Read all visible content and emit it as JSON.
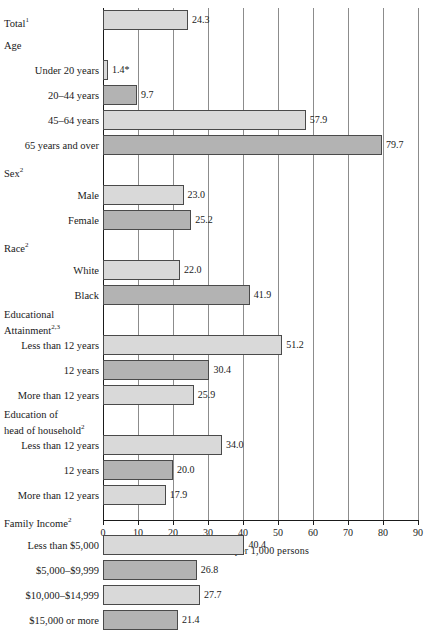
{
  "chart_data": {
    "type": "bar",
    "orientation": "horizontal",
    "title": "",
    "subtitle": "",
    "xlabel": "Rate per 1,000  persons",
    "ylabel": "",
    "xlim": [
      0,
      90
    ],
    "xticks": [
      0,
      10,
      20,
      30,
      40,
      50,
      60,
      70,
      80,
      90
    ],
    "xticklabels": [
      "0",
      "10",
      "20",
      "30",
      "40",
      "50",
      "60",
      "70",
      "80",
      "90"
    ],
    "grid": true,
    "grid_axis": "x",
    "legend": null,
    "colors": {
      "bar_light": "#d9d9d9",
      "bar_dark": "#b3b3b3",
      "bar_border": "#4a4a4a",
      "gridline": "#8c8c8c",
      "axis": "#1a1a1a"
    },
    "footnote_markers": [
      "1",
      "2",
      "3",
      "*"
    ],
    "rows": [
      {
        "kind": "bar",
        "indent": 0,
        "label": "Total",
        "sup": "1",
        "value": 24.3,
        "value_label": "24.3",
        "fill": "light"
      },
      {
        "kind": "header",
        "indent": 0,
        "label": "Age",
        "sup": "",
        "value": null,
        "value_label": "",
        "fill": ""
      },
      {
        "kind": "bar",
        "indent": 1,
        "label": "Under 20 years",
        "sup": "",
        "value": 1.4,
        "value_label": "1.4*",
        "fill": "light"
      },
      {
        "kind": "bar",
        "indent": 1,
        "label": "20–44 years",
        "sup": "",
        "value": 9.7,
        "value_label": "9.7",
        "fill": "dark"
      },
      {
        "kind": "bar",
        "indent": 1,
        "label": "45–64 years",
        "sup": "",
        "value": 57.9,
        "value_label": "57.9",
        "fill": "light"
      },
      {
        "kind": "bar",
        "indent": 1,
        "label": "65 years and over",
        "sup": "",
        "value": 79.7,
        "value_label": "79.7",
        "fill": "dark"
      },
      {
        "kind": "header",
        "indent": 0,
        "label": "Sex",
        "sup": "2",
        "value": null,
        "value_label": "",
        "fill": ""
      },
      {
        "kind": "bar",
        "indent": 1,
        "label": "Male",
        "sup": "",
        "value": 23.0,
        "value_label": "23.0",
        "fill": "light"
      },
      {
        "kind": "bar",
        "indent": 1,
        "label": "Female",
        "sup": "",
        "value": 25.2,
        "value_label": "25.2",
        "fill": "dark"
      },
      {
        "kind": "header",
        "indent": 0,
        "label": "Race",
        "sup": "2",
        "value": null,
        "value_label": "",
        "fill": ""
      },
      {
        "kind": "bar",
        "indent": 1,
        "label": "White",
        "sup": "",
        "value": 22.0,
        "value_label": "22.0",
        "fill": "light"
      },
      {
        "kind": "bar",
        "indent": 1,
        "label": "Black",
        "sup": "",
        "value": 41.9,
        "value_label": "41.9",
        "fill": "dark"
      },
      {
        "kind": "header2",
        "indent": 0,
        "label": "Educational",
        "label2": "Attainment",
        "sup": "2,3",
        "value": null,
        "value_label": "",
        "fill": ""
      },
      {
        "kind": "bar",
        "indent": 1,
        "label": "Less than 12 years",
        "sup": "",
        "value": 51.2,
        "value_label": "51.2",
        "fill": "light"
      },
      {
        "kind": "bar",
        "indent": 1,
        "label": "12 years",
        "sup": "",
        "value": 30.4,
        "value_label": "30.4",
        "fill": "dark"
      },
      {
        "kind": "bar",
        "indent": 1,
        "label": "More than 12 years",
        "sup": "",
        "value": 25.9,
        "value_label": "25.9",
        "fill": "light"
      },
      {
        "kind": "header2",
        "indent": 0,
        "label": "Education of",
        "label2": "head of household",
        "sup": "2",
        "value": null,
        "value_label": "",
        "fill": ""
      },
      {
        "kind": "bar",
        "indent": 1,
        "label": "Less than 12 years",
        "sup": "",
        "value": 34.0,
        "value_label": "34.0",
        "fill": "light"
      },
      {
        "kind": "bar",
        "indent": 1,
        "label": "12 years",
        "sup": "",
        "value": 20.0,
        "value_label": "20.0",
        "fill": "dark"
      },
      {
        "kind": "bar",
        "indent": 1,
        "label": "More than 12 years",
        "sup": "",
        "value": 17.9,
        "value_label": "17.9",
        "fill": "light"
      },
      {
        "kind": "header",
        "indent": 0,
        "label": "Family Income",
        "sup": "2",
        "value": null,
        "value_label": "",
        "fill": ""
      },
      {
        "kind": "bar",
        "indent": 1,
        "label": "Less than $5,000",
        "sup": "",
        "value": 40.4,
        "value_label": "40.4",
        "fill": "light"
      },
      {
        "kind": "bar",
        "indent": 1,
        "label": "$5,000–$9,999",
        "sup": "",
        "value": 26.8,
        "value_label": "26.8",
        "fill": "dark"
      },
      {
        "kind": "bar",
        "indent": 1,
        "label": "$10,000–$14,999",
        "sup": "",
        "value": 27.7,
        "value_label": "27.7",
        "fill": "light"
      },
      {
        "kind": "bar",
        "indent": 1,
        "label": "$15,000 or more",
        "sup": "",
        "value": 21.4,
        "value_label": "21.4",
        "fill": "dark"
      }
    ]
  }
}
